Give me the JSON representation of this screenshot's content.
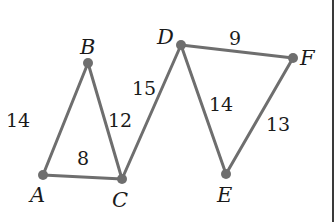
{
  "diagram": {
    "type": "weighted-graph",
    "colors": {
      "edge": "#6e6e6e",
      "node": "#6e6e6e",
      "text": "#1a1a1a",
      "background": "#ffffff",
      "frame": "#3a3a3a"
    },
    "vertices": [
      {
        "id": "A",
        "label": "A",
        "x": 43,
        "y": 175,
        "lx": 30,
        "ly": 202
      },
      {
        "id": "B",
        "label": "B",
        "x": 88,
        "y": 63,
        "lx": 80,
        "ly": 54
      },
      {
        "id": "C",
        "label": "C",
        "x": 122,
        "y": 179,
        "lx": 112,
        "ly": 207
      },
      {
        "id": "D",
        "label": "D",
        "x": 181,
        "y": 45,
        "lx": 157,
        "ly": 44
      },
      {
        "id": "E",
        "label": "E",
        "x": 226,
        "y": 174,
        "lx": 217,
        "ly": 202
      },
      {
        "id": "F",
        "label": "F",
        "x": 293,
        "y": 58,
        "lx": 300,
        "ly": 65
      }
    ],
    "edges": [
      {
        "from": "A",
        "to": "B",
        "weight": "14",
        "lx": 6,
        "ly": 127
      },
      {
        "from": "B",
        "to": "C",
        "weight": "12",
        "lx": 108,
        "ly": 127
      },
      {
        "from": "A",
        "to": "C",
        "weight": "8",
        "lx": 77,
        "ly": 165
      },
      {
        "from": "C",
        "to": "D",
        "weight": "15",
        "lx": 132,
        "ly": 95
      },
      {
        "from": "D",
        "to": "F",
        "weight": "9",
        "lx": 229,
        "ly": 45
      },
      {
        "from": "D",
        "to": "E",
        "weight": "14",
        "lx": 209,
        "ly": 111
      },
      {
        "from": "E",
        "to": "F",
        "weight": "13",
        "lx": 266,
        "ly": 131
      }
    ],
    "frame": {
      "right_border_x": 333
    }
  }
}
